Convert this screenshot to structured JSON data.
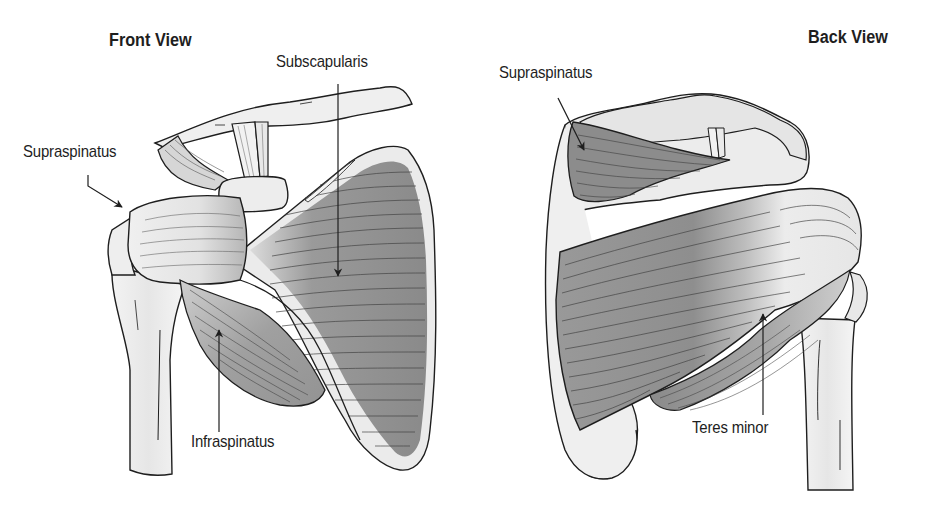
{
  "figure": {
    "views": [
      {
        "title": "Front View",
        "labels": [
          {
            "text": "Subscapularis"
          },
          {
            "text": "Supraspinatus"
          },
          {
            "text": "Infraspinatus"
          }
        ]
      },
      {
        "title": "Back View",
        "labels": [
          {
            "text": "Supraspinatus"
          },
          {
            "text": "Teres minor"
          }
        ]
      }
    ]
  },
  "colors": {
    "background": "#ffffff",
    "outline": "#1e1e1e",
    "bone": "#ececec",
    "muscle_dark": "#8f8f8f",
    "muscle_light": "#e4e4e4",
    "text": "#1e1e1e"
  }
}
